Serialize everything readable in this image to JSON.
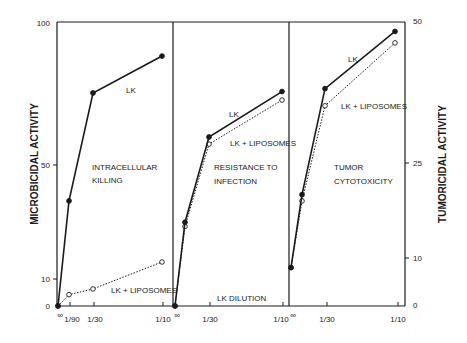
{
  "chart_data": {
    "type": "line",
    "xlabel": "LK DILUTION",
    "left_ylabel": "MICROBICIDAL ACTIVITY",
    "right_ylabel": "TUMORICIDAL ACTIVITY",
    "left_yticks": [
      0,
      10,
      50,
      100
    ],
    "right_yticks": [
      0,
      10,
      25,
      50
    ],
    "left_ylim": [
      0,
      100
    ],
    "right_ylim": [
      0,
      50
    ],
    "x_categories": [
      "∞",
      "1/90",
      "1/30",
      "1/10"
    ],
    "grid": false,
    "legend": "inline labels",
    "panels": [
      {
        "title": "INTRACELLULAR KILLING",
        "axis": "left",
        "xtick_labels": [
          "∞",
          "1/90",
          "1/30",
          "1/10"
        ],
        "series": [
          {
            "name": "LK",
            "style": "solid-filled",
            "values": [
              0,
              37,
              75,
              88
            ]
          },
          {
            "name": "LK + LIPOSOMES",
            "style": "dotted-open",
            "values": [
              0,
              4,
              6,
              15.5
            ]
          }
        ]
      },
      {
        "title": "RESISTANCE TO INFECTION",
        "axis": "left",
        "xtick_labels": [
          "∞",
          "",
          "1/30",
          "1/10"
        ],
        "series": [
          {
            "name": "LK",
            "style": "solid-filled",
            "values": [
              0,
              29.5,
              59.5,
              75.5
            ]
          },
          {
            "name": "LK + LIPOSOMES",
            "style": "dotted-open",
            "values": [
              0,
              28,
              57,
              72.5
            ]
          }
        ]
      },
      {
        "title": "TUMOR CYTOTOXICITY",
        "axis": "right",
        "xtick_labels": [
          "∞",
          "",
          "1/30",
          "1/10"
        ],
        "series": [
          {
            "name": "LK",
            "style": "solid-filled",
            "values": [
              8,
              20,
              38,
              48
            ]
          },
          {
            "name": "LK + LIPOSOMES",
            "style": "dotted-open",
            "values": [
              8,
              19,
              35,
              46
            ]
          }
        ]
      }
    ]
  },
  "labels": {
    "panel1_title_line1": "INTRACELLULAR",
    "panel1_title_line2": "KILLING",
    "panel2_title_line1": "RESISTANCE TO",
    "panel2_title_line2": "INFECTION",
    "panel3_title_line1": "TUMOR",
    "panel3_title_line2": "CYTOTOXICITY",
    "lk": "LK",
    "lk_lip": "LK + LIPOSOMES",
    "xlabel": "LK DILUTION",
    "left_ylabel": "MICROBICIDAL ACTIVITY",
    "right_ylabel": "TUMORICIDAL ACTIVITY",
    "left_ticks": [
      "100",
      "50",
      "10",
      "0"
    ],
    "right_ticks": [
      "50",
      "25",
      "10",
      "0"
    ],
    "x_ticks": [
      "∞",
      "1/90",
      "1/30",
      "1/10",
      "∞",
      "1/30",
      "1/10",
      "∞",
      "1/30",
      "1/10"
    ]
  }
}
